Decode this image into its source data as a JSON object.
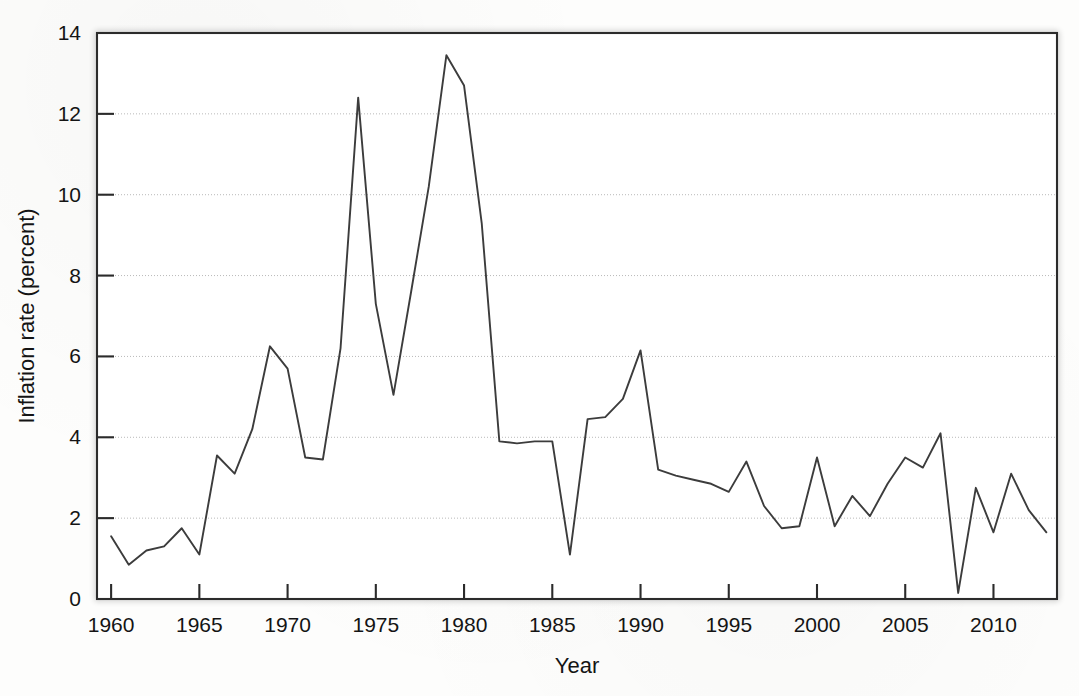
{
  "chart_data": {
    "type": "line",
    "title": "",
    "subtitle": "",
    "xlabel": "Year",
    "ylabel": "Inflation rate (percent)",
    "xlim": [
      1959.2,
      2013.6
    ],
    "ylim": [
      0,
      14
    ],
    "grid": true,
    "grid_axis": "y",
    "legend": "none",
    "line_color": "#3c3c3c",
    "frame_color": "#2b2b2b",
    "gridline_color": "#b9b9b9",
    "background_color": "#fdfdfc",
    "x_ticks": [
      1960,
      1965,
      1970,
      1975,
      1980,
      1985,
      1990,
      1995,
      2000,
      2005,
      2010
    ],
    "x_tick_labels": [
      "1960",
      "1965",
      "1970",
      "1975",
      "1980",
      "1985",
      "1990",
      "1995",
      "2000",
      "2005",
      "2010"
    ],
    "y_ticks": [
      0,
      2,
      4,
      6,
      8,
      10,
      12,
      14
    ],
    "y_tick_labels": [
      "0",
      "2",
      "4",
      "6",
      "8",
      "10",
      "12",
      "14"
    ],
    "series": [
      {
        "name": "Inflation rate",
        "x": [
          1960,
          1961,
          1962,
          1963,
          1964,
          1965,
          1966,
          1967,
          1968,
          1969,
          1970,
          1971,
          1972,
          1973,
          1974,
          1975,
          1976,
          1977,
          1978,
          1979,
          1980,
          1981,
          1982,
          1983,
          1984,
          1985,
          1986,
          1987,
          1988,
          1989,
          1990,
          1991,
          1992,
          1993,
          1994,
          1995,
          1996,
          1997,
          1998,
          1999,
          2000,
          2001,
          2002,
          2003,
          2004,
          2005,
          2006,
          2007,
          2008,
          2009,
          2010,
          2011,
          2012,
          2013
        ],
        "values": [
          1.55,
          0.85,
          1.2,
          1.3,
          1.75,
          1.1,
          3.55,
          3.1,
          4.2,
          6.25,
          5.7,
          3.5,
          3.45,
          6.2,
          12.4,
          7.3,
          5.05,
          7.6,
          10.2,
          13.45,
          12.7,
          9.3,
          3.9,
          3.85,
          3.9,
          3.9,
          1.1,
          4.45,
          4.5,
          4.95,
          6.15,
          3.2,
          3.05,
          2.95,
          2.85,
          2.65,
          3.4,
          2.3,
          1.75,
          1.8,
          3.5,
          1.8,
          2.55,
          2.05,
          2.85,
          3.5,
          3.25,
          4.1,
          0.15,
          2.75,
          1.65,
          3.1,
          2.2,
          1.65
        ]
      }
    ]
  }
}
